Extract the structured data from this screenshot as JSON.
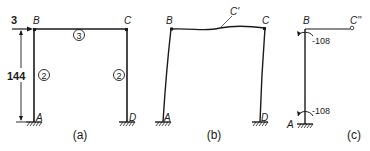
{
  "figure": {
    "panels": [
      {
        "id": "a",
        "caption": "(a)",
        "joints": {
          "A": "A",
          "B": "B",
          "C": "C",
          "D": "D"
        },
        "load": "3",
        "dimension": "144",
        "members": {
          "left_column": "2",
          "beam": "3",
          "right_column": "2"
        }
      },
      {
        "id": "b",
        "caption": "(b)",
        "joints": {
          "A": "A",
          "B": "B",
          "C": "C",
          "D": "D",
          "C_prime": "C'"
        }
      },
      {
        "id": "c",
        "caption": "(c)",
        "joints": {
          "A": "A",
          "B": "B",
          "C_double_prime": "C''"
        },
        "moments": {
          "top": "-108",
          "bottom": "-108"
        }
      }
    ]
  }
}
